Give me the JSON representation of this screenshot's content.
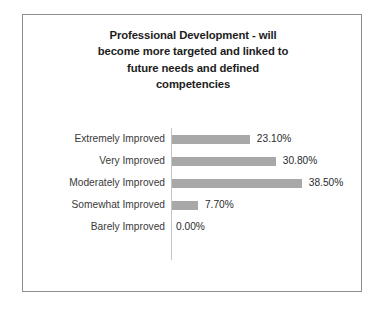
{
  "chart_data": {
    "type": "bar",
    "orientation": "horizontal",
    "title": "Professional Development - will become more targeted and linked to future needs and defined competencies",
    "title_lines": [
      "Professional Development - will",
      "become more targeted and linked to",
      "future needs and defined",
      "competencies"
    ],
    "categories": [
      "Extremely Improved",
      "Very Improved",
      "Moderately Improved",
      "Somewhat Improved",
      "Barely Improved"
    ],
    "values": [
      23.1,
      30.8,
      38.5,
      7.7,
      0.0
    ],
    "value_labels": [
      "23.10%",
      "30.80%",
      "38.50%",
      "7.70%",
      "0.00%"
    ],
    "xlabel": "",
    "ylabel": "",
    "xlim": [
      0,
      38.5
    ],
    "grid": false,
    "legend": false,
    "units": "percent",
    "bar_color": "#a8a8a8",
    "axis_color": "#c4c4c4",
    "border_color": "#8d8d8d",
    "background_color": "#ffffff",
    "title_color": "#1d1d1d",
    "label_color": "#3a3a3a",
    "value_color": "#2b2b2b",
    "px_per_percent": 3.37
  }
}
